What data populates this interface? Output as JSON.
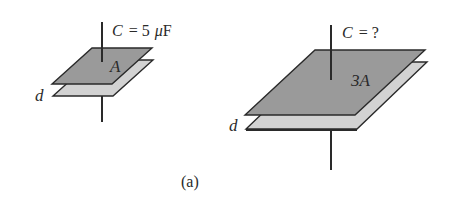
{
  "figure": {
    "caption": "(a)",
    "capacitors": [
      {
        "id": "left",
        "capacitance_label": "C = 5 μF",
        "cap_symbol": "C",
        "cap_eq": "= 5",
        "cap_unit_mu": "μ",
        "cap_unit_F": "F",
        "area_label": "A",
        "separation_label": "d"
      },
      {
        "id": "right",
        "capacitance_label": "C = ?",
        "cap_symbol": "C",
        "cap_eq": "= ?",
        "area_label": "3A",
        "separation_label": "d"
      }
    ],
    "colors": {
      "top_plate": "#9a9a9a",
      "bottom_plate": "#d2d2d2",
      "outline": "#2a2a2a",
      "background": "#ffffff"
    }
  }
}
